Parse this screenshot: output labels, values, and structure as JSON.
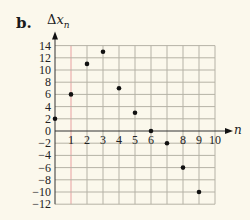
{
  "figure": {
    "part_label": "b.",
    "y_axis_title_delta": "Δ",
    "y_axis_title_var": "x",
    "y_axis_title_sub": "n",
    "x_axis_title": "n"
  },
  "colors": {
    "background": "#fbf8ec",
    "grid": "#b5b2a6",
    "axis": "#333333",
    "points": "#111111",
    "highlight_gridline": "#e8a0a0"
  },
  "chart_data": {
    "type": "scatter",
    "title": "",
    "xlabel": "n",
    "ylabel": "Δx_n",
    "x": [
      0,
      1,
      2,
      3,
      4,
      5,
      6,
      7,
      8,
      9
    ],
    "y": [
      2,
      6,
      11,
      13,
      7,
      3,
      0,
      -2,
      -6,
      -10
    ],
    "xlim": [
      0,
      10
    ],
    "ylim": [
      -12,
      14
    ],
    "x_ticks": [
      1,
      2,
      3,
      4,
      5,
      6,
      7,
      8,
      9,
      10
    ],
    "x_tick_labels": [
      "1",
      "2",
      "3",
      "4",
      "5",
      "6",
      "",
      "8",
      "9",
      "10"
    ],
    "y_ticks": [
      14,
      12,
      10,
      8,
      6,
      4,
      2,
      0,
      -2,
      -4,
      -6,
      -8,
      -10,
      -12
    ],
    "y_tick_labels": [
      "14",
      "12",
      "10",
      "8",
      "6",
      "4",
      "2",
      "0",
      "−2",
      "−4",
      "−6",
      "−8",
      "−10",
      "−12"
    ],
    "grid": true,
    "legend": null
  }
}
